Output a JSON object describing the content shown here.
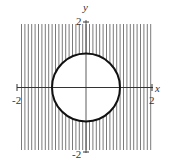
{
  "figure": {
    "axis_labels": {
      "x": "x",
      "y": "y"
    },
    "ticks": {
      "x_min": "-2",
      "x_max": "2",
      "y_max": "2",
      "y_min": "-2"
    },
    "domain": {
      "x": [
        -2,
        2
      ],
      "y": [
        -2,
        2
      ]
    },
    "circle": {
      "center": [
        0,
        0
      ],
      "radius": 1
    },
    "shading": "vertical-lines",
    "colors": {
      "hatch": "#777777",
      "circle": "#111111",
      "axes": "#333333",
      "background": "#ffffff"
    }
  }
}
